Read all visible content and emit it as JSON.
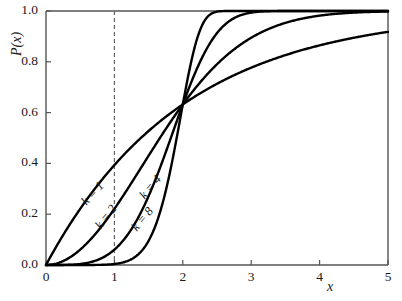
{
  "chart_data": {
    "type": "line",
    "title": "",
    "xlabel": "x",
    "ylabel": "P(x)",
    "xlim": [
      0,
      5
    ],
    "ylim": [
      0,
      1
    ],
    "xticks": [
      "0",
      "1",
      "2",
      "3",
      "4",
      "5"
    ],
    "xtick_values": [
      0,
      1,
      2,
      3,
      4,
      5
    ],
    "yticks": [
      "0.0",
      "0.2",
      "0.4",
      "0.6",
      "0.8",
      "1.0"
    ],
    "ytick_values": [
      0,
      0.2,
      0.4,
      0.6,
      0.8,
      1.0
    ],
    "grid": false,
    "legend": "inline-curve-labels",
    "function": "P(x) = 1 - exp(-(x/2)^k)",
    "scale_lambda": 2,
    "annotations": [
      {
        "name": "vertical-dashed-line",
        "x": 1,
        "style": "dashed",
        "from_y": 0,
        "to_y": 1
      }
    ],
    "series": [
      {
        "name": "k = 1",
        "label": "k = 1",
        "k": 1,
        "x": [
          0,
          0.25,
          0.5,
          0.75,
          1,
          1.25,
          1.5,
          1.75,
          2,
          2.5,
          3,
          3.5,
          4,
          4.5,
          5
        ],
        "values": [
          0.0,
          0.118,
          0.221,
          0.313,
          0.393,
          0.465,
          0.528,
          0.583,
          0.632,
          0.713,
          0.777,
          0.826,
          0.865,
          0.895,
          0.918
        ]
      },
      {
        "name": "k = 2",
        "label": "k = 2",
        "k": 2,
        "x": [
          0,
          0.25,
          0.5,
          0.75,
          1,
          1.25,
          1.5,
          1.75,
          2,
          2.5,
          3,
          3.5,
          4,
          4.5,
          5
        ],
        "values": [
          0.0,
          0.0155,
          0.0606,
          0.1315,
          0.221,
          0.323,
          0.43,
          0.536,
          0.632,
          0.79,
          0.895,
          0.954,
          0.982,
          0.994,
          0.998
        ]
      },
      {
        "name": "k = 4",
        "label": "k = 4",
        "k": 4,
        "x": [
          0,
          0.25,
          0.5,
          0.75,
          1,
          1.25,
          1.5,
          1.75,
          2,
          2.5,
          3,
          3.5,
          4,
          4.5,
          5
        ],
        "values": [
          0.0,
          0.0002,
          0.0039,
          0.0194,
          0.0606,
          0.1429,
          0.2733,
          0.4412,
          0.632,
          0.9061,
          0.9936,
          0.99987,
          1.0,
          1.0,
          1.0
        ]
      },
      {
        "name": "k = 8",
        "label": "k = 8",
        "k": 8,
        "x": [
          0,
          0.25,
          0.5,
          0.75,
          1,
          1.25,
          1.5,
          1.75,
          2,
          2.5,
          3,
          3.5,
          4,
          4.5,
          5
        ],
        "values": [
          0.0,
          0.0,
          1.53e-05,
          0.0005,
          0.0039,
          0.02,
          0.0747,
          0.2182,
          0.632,
          0.9983,
          1.0,
          1.0,
          1.0,
          1.0,
          1.0
        ]
      }
    ],
    "curve_labels": [
      {
        "text": "k = 1",
        "x": 84,
        "y": 196,
        "rotate": -48
      },
      {
        "text": "k = 2",
        "x": 98,
        "y": 220,
        "rotate": -52
      },
      {
        "text": "k = 8",
        "x": 134,
        "y": 222,
        "rotate": -50
      },
      {
        "text": "k = 4",
        "x": 142,
        "y": 190,
        "rotate": -50
      }
    ]
  },
  "axes": {
    "frame_color": "#555555",
    "curve_color": "#000000",
    "dash_color": "#666666"
  }
}
